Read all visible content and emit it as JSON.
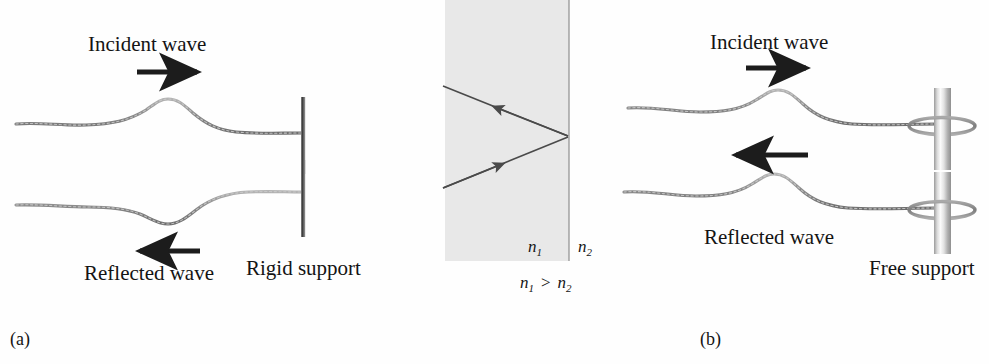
{
  "figure": {
    "width": 989,
    "height": 364,
    "background": "#fefefe"
  },
  "panel_a": {
    "caption": "(a)",
    "incident_label": "Incident wave",
    "reflected_label": "Reflected wave",
    "support_label": "Rigid support",
    "incident_arrow_direction": "right",
    "reflected_arrow_direction": "left",
    "pulse_incident_orientation": "crest-up",
    "pulse_reflected_orientation": "trough-down",
    "support_type": "rigid",
    "note_inverted": "reflected pulse is inverted"
  },
  "panel_mid": {
    "medium_left_label": "n",
    "medium_left_sub": "1",
    "medium_right_label": "n",
    "medium_right_sub": "2",
    "relation_left": "n",
    "relation_left_sub": "1",
    "relation_operator": ">",
    "relation_right": "n",
    "relation_right_sub": "2",
    "relation_full": "n1 > n2",
    "incident_ray_direction": "up-right toward interface",
    "reflected_ray_direction": "up-left away from interface",
    "interface_orientation": "vertical",
    "shaded_medium": "n1",
    "shade_color": "#e8e8e8",
    "ray_color": "#4a4a4a"
  },
  "panel_b": {
    "caption": "(b)",
    "incident_label": "Incident wave",
    "reflected_label": "Reflected wave",
    "support_label": "Free support",
    "incident_arrow_direction": "right",
    "reflected_arrow_direction": "left",
    "pulse_incident_orientation": "crest-up",
    "pulse_reflected_orientation": "crest-up",
    "support_type": "free",
    "note_inverted": "reflected pulse is not inverted"
  },
  "colors": {
    "rope": "#8d8d8d",
    "rope_dark": "#6a6a6a",
    "arrow": "#1c1c1c",
    "support_bar": "#555555",
    "pole_light": "#f2f2f2",
    "pole_mid": "#bdbdbd",
    "text": "#141414"
  }
}
